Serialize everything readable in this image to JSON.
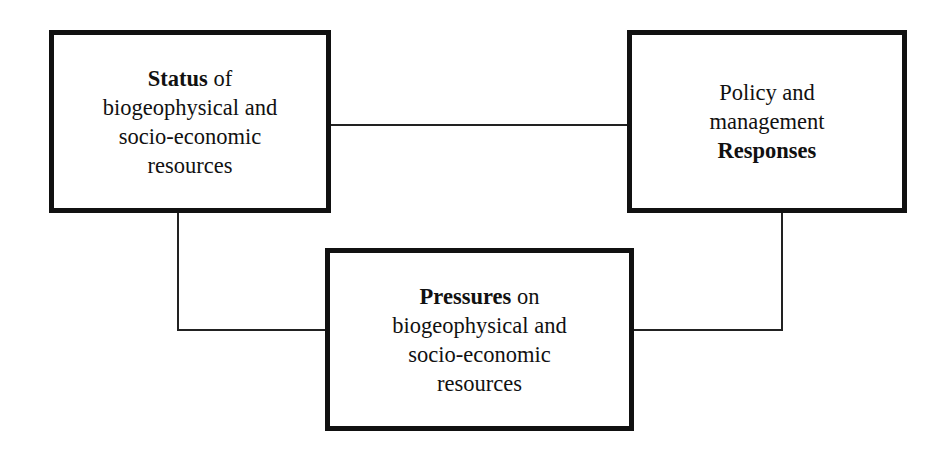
{
  "diagram": {
    "title": "",
    "nodes": [
      {
        "id": "status",
        "lines": [
          {
            "bold": "Status",
            "rest": " of"
          },
          {
            "bold": "",
            "rest": "biogeophysical and"
          },
          {
            "bold": "",
            "rest": "socio-economic"
          },
          {
            "bold": "",
            "rest": "resources"
          }
        ]
      },
      {
        "id": "responses",
        "lines": [
          {
            "bold": "",
            "rest": "Policy and"
          },
          {
            "bold": "",
            "rest": "management"
          },
          {
            "bold": "Responses",
            "rest": ""
          }
        ]
      },
      {
        "id": "pressures",
        "lines": [
          {
            "bold": "Pressures",
            "rest": " on"
          },
          {
            "bold": "",
            "rest": "biogeophysical and"
          },
          {
            "bold": "",
            "rest": "socio-economic"
          },
          {
            "bold": "",
            "rest": "resources"
          }
        ]
      }
    ],
    "edges": [
      {
        "from": "status",
        "to": "responses"
      },
      {
        "from": "status",
        "to": "pressures"
      },
      {
        "from": "responses",
        "to": "pressures"
      }
    ],
    "colors": {
      "border": "#111111",
      "line": "#222222",
      "background": "#ffffff",
      "text": "#111111"
    }
  }
}
